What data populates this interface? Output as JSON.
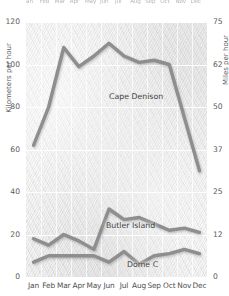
{
  "chart_data": {
    "type": "line",
    "title": "",
    "subtitle": "",
    "xlabel": "",
    "ylabel": "Kilometers per hour",
    "y2label": "Miles per hour",
    "categories": [
      "Jan",
      "Feb",
      "Mar",
      "Apr",
      "May",
      "Jun",
      "Jul",
      "Aug",
      "Sep",
      "Oct",
      "Nov",
      "Dec"
    ],
    "ylim": [
      0,
      120
    ],
    "yticks": [
      0,
      20,
      40,
      60,
      80,
      100,
      120
    ],
    "y2lim": [
      0,
      75
    ],
    "y2ticks": [
      0,
      12,
      25,
      37,
      50,
      62,
      75
    ],
    "grid": true,
    "legend_position": "inline-labels",
    "series": [
      {
        "name": "Cape Denison",
        "color": "#8e8e8e",
        "values": [
          62,
          80,
          108,
          99,
          104,
          110,
          104,
          101,
          102,
          100,
          75,
          50
        ]
      },
      {
        "name": "Butler Island",
        "color": "#8e8e8e",
        "values": [
          18,
          15,
          20,
          17,
          13,
          32,
          27,
          28,
          25,
          22,
          23,
          21
        ]
      },
      {
        "name": "Dome C",
        "color": "#8e8e8e",
        "values": [
          7,
          10,
          10,
          10,
          10,
          7,
          12,
          6,
          10,
          11,
          13,
          11
        ]
      }
    ],
    "annotations": [
      {
        "text": "Cape Denison",
        "x": "Apr",
        "y": 95
      },
      {
        "text": "Butler Island",
        "x": "Jun",
        "y": 36
      },
      {
        "text": "Dome C",
        "x": "Aug",
        "y": 17
      }
    ]
  },
  "axes": {
    "left": {
      "title": "Kilometers per hour",
      "ticks": [
        "120",
        "100",
        "80",
        "60",
        "40",
        "20",
        "0"
      ]
    },
    "right": {
      "title": "Miles per hour",
      "ticks": [
        "75",
        "62",
        "50",
        "37",
        "25",
        "12",
        "0"
      ]
    },
    "bottom": {
      "months": [
        "Jan",
        "Feb",
        "Mar",
        "Apr",
        "May",
        "Jun",
        "Jul",
        "Aug",
        "Sep",
        "Oct",
        "Nov",
        "Dec"
      ]
    },
    "top_clipped": {
      "months": [
        "Jan",
        "Feb",
        "Mar",
        "Apr",
        "May",
        "Jun",
        "Jul",
        "Aug",
        "Sep",
        "Oct",
        "Nov",
        "Dec"
      ]
    }
  },
  "labels": {
    "cape_denison": "Cape Denison",
    "butler_island": "Butler Island",
    "dome_c": "Dome C"
  },
  "colors": {
    "line": "#8e8e8e",
    "plot_background": "#e9e9e9",
    "gridline": "#ffffff",
    "text": "#4f4f4f"
  }
}
